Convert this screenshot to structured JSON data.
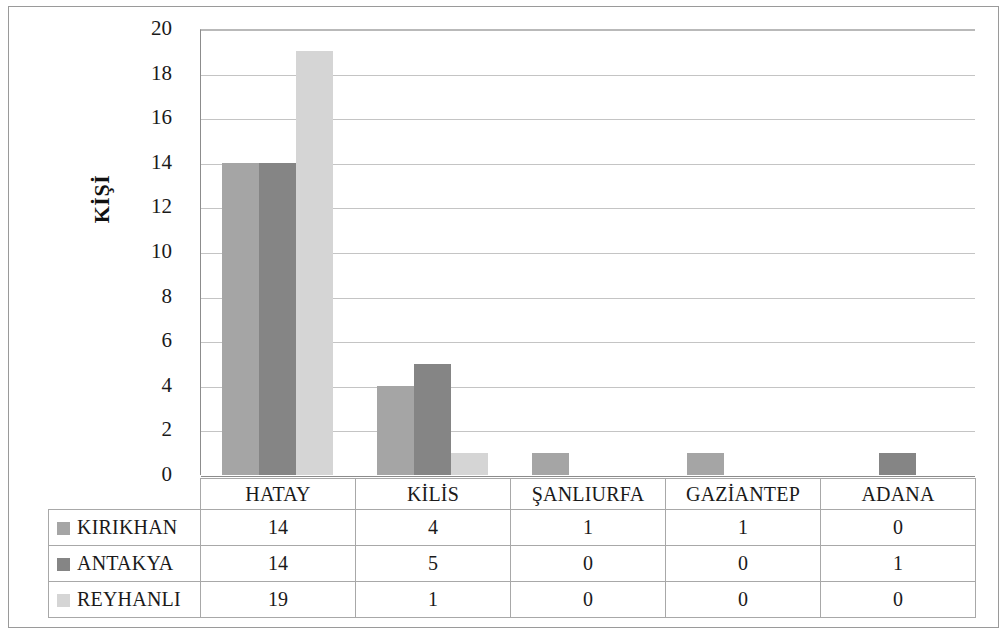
{
  "chart_data": {
    "type": "bar",
    "title": "",
    "xlabel": "",
    "ylabel": "KİŞİ",
    "ylim": [
      0,
      20
    ],
    "ytick_step": 2,
    "yticks": [
      "20",
      "18",
      "16",
      "14",
      "12",
      "10",
      "8",
      "6",
      "4",
      "2",
      "0"
    ],
    "grid": true,
    "legend_position": "data-table",
    "categories": [
      "HATAY",
      "KİLİS",
      "ŞANLIURFA",
      "GAZİANTEP",
      "ADANA"
    ],
    "series": [
      {
        "name": "KIRIKHAN",
        "color": "#a5a5a5",
        "values": [
          14,
          4,
          1,
          1,
          0
        ]
      },
      {
        "name": "ANTAKYA",
        "color": "#858585",
        "values": [
          14,
          5,
          0,
          0,
          1
        ]
      },
      {
        "name": "REYHANLI",
        "color": "#d5d5d5",
        "values": [
          19,
          1,
          0,
          0,
          0
        ]
      }
    ]
  },
  "table": {
    "corner_label": "",
    "column_headers": [
      "HATAY",
      "KİLİS",
      "ŞANLIURFA",
      "GAZİANTEP",
      "ADANA"
    ],
    "rows": [
      {
        "label": "KIRIKHAN",
        "swatch": "#a5a5a5",
        "values": [
          "14",
          "4",
          "1",
          "1",
          "0"
        ]
      },
      {
        "label": "ANTAKYA",
        "swatch": "#858585",
        "values": [
          "14",
          "5",
          "0",
          "0",
          "1"
        ]
      },
      {
        "label": "REYHANLI",
        "swatch": "#d5d5d5",
        "values": [
          "19",
          "1",
          "0",
          "0",
          "0"
        ]
      }
    ]
  },
  "colors": {
    "gridline": "#c4c4c4",
    "axis": "#8c8c8c",
    "frame": "#9a9a9a",
    "table_border": "#a8a8a8",
    "text": "#1a1a1a"
  }
}
